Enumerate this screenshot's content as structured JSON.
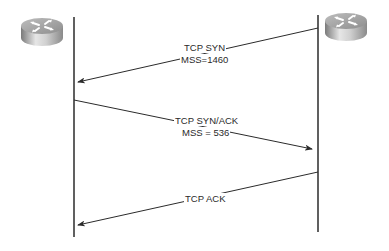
{
  "diagram": {
    "type": "sequence",
    "title": "",
    "colors": {
      "line": "#2b2b2b",
      "text": "#2a2a2a",
      "router_body": "#a8a8a8",
      "router_top": "#cfcfcf",
      "background": "#ffffff"
    },
    "nodes": [
      {
        "id": "router-left",
        "icon": "router-icon",
        "label": ""
      },
      {
        "id": "router-right",
        "icon": "router-icon",
        "label": ""
      }
    ],
    "messages": [
      {
        "from": "router-right",
        "to": "router-left",
        "line1": "TCP SYN",
        "line2": "MSS=1460"
      },
      {
        "from": "router-left",
        "to": "router-right",
        "line1": "TCP SYN/ACK",
        "line2": "MSS = 536"
      },
      {
        "from": "router-right",
        "to": "router-left",
        "line1": "TCP ACK",
        "line2": ""
      }
    ]
  }
}
